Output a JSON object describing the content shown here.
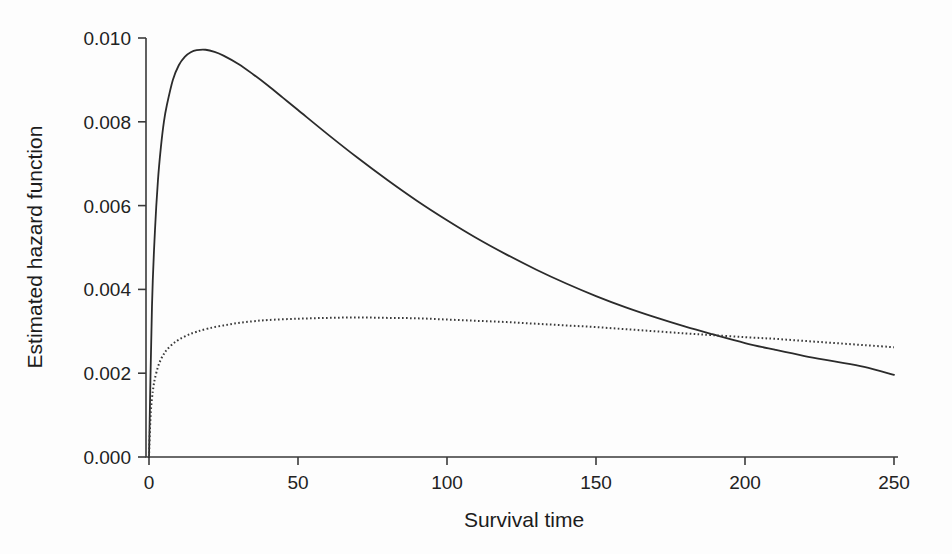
{
  "figure": {
    "background_color": "#fdfdfd",
    "axis_color": "#3a3a3a",
    "title": ""
  },
  "axes": {
    "xlabel": "Survival time",
    "ylabel": "Estimated hazard function",
    "xticks": [
      "0",
      "50",
      "100",
      "150",
      "200",
      "250"
    ],
    "yticks": [
      "0.000",
      "0.002",
      "0.004",
      "0.006",
      "0.008",
      "0.010"
    ]
  },
  "chart_data": {
    "type": "line",
    "title": "",
    "xlabel": "Survival time",
    "ylabel": "Estimated hazard function",
    "xlim": [
      0,
      250
    ],
    "ylim": [
      0.0,
      0.01
    ],
    "xticks": [
      0,
      50,
      100,
      150,
      200,
      250
    ],
    "yticks": [
      0.0,
      0.002,
      0.004,
      0.006,
      0.008,
      0.01
    ],
    "grid": false,
    "legend": "none",
    "annotations": [
      "Solid curve peaks near t = 19 at about 0.0097, then decays monotonically.",
      "Dotted curve rises steeply, peaks near t = 70 at about 0.0033, then decays slowly.",
      "The two curves cross near t = 189 at about 0.0029."
    ],
    "series": [
      {
        "name": "solid-curve",
        "style": "solid",
        "color": "#2b2b2b",
        "x": [
          0,
          1,
          2,
          3,
          4,
          5,
          6,
          8,
          10,
          12,
          14,
          16,
          19,
          22,
          25,
          30,
          35,
          40,
          45,
          50,
          60,
          70,
          80,
          90,
          100,
          110,
          120,
          130,
          140,
          150,
          160,
          170,
          180,
          189,
          200,
          210,
          220,
          230,
          240,
          250
        ],
        "y": [
          0.0,
          0.0036,
          0.0054,
          0.0066,
          0.0074,
          0.008,
          0.0084,
          0.009,
          0.00935,
          0.00955,
          0.00966,
          0.00971,
          0.00972,
          0.00967,
          0.00958,
          0.00938,
          0.00913,
          0.00886,
          0.00857,
          0.00828,
          0.0077,
          0.00714,
          0.00661,
          0.00611,
          0.00565,
          0.00522,
          0.00483,
          0.00447,
          0.00414,
          0.00384,
          0.00357,
          0.00333,
          0.00311,
          0.00293,
          0.00272,
          0.00256,
          0.00241,
          0.00228,
          0.00215,
          0.00196
        ]
      },
      {
        "name": "dotted-curve",
        "style": "dotted",
        "color": "#3a3a3a",
        "x": [
          0,
          0.5,
          1,
          1.5,
          2,
          3,
          4,
          5,
          6,
          8,
          10,
          13,
          16,
          20,
          25,
          30,
          35,
          40,
          50,
          60,
          70,
          80,
          90,
          100,
          110,
          120,
          130,
          140,
          150,
          160,
          170,
          180,
          189,
          200,
          210,
          220,
          230,
          240,
          250
        ],
        "y": [
          0.0,
          0.00095,
          0.0014,
          0.00168,
          0.00188,
          0.00215,
          0.00233,
          0.00246,
          0.00256,
          0.0027,
          0.0028,
          0.00291,
          0.00299,
          0.00307,
          0.00314,
          0.0032,
          0.00324,
          0.00327,
          0.0033,
          0.00332,
          0.00333,
          0.00332,
          0.00331,
          0.00328,
          0.00325,
          0.00322,
          0.00318,
          0.00314,
          0.0031,
          0.00305,
          0.003,
          0.00295,
          0.00291,
          0.00286,
          0.00282,
          0.00277,
          0.00272,
          0.00267,
          0.00262
        ]
      }
    ]
  }
}
